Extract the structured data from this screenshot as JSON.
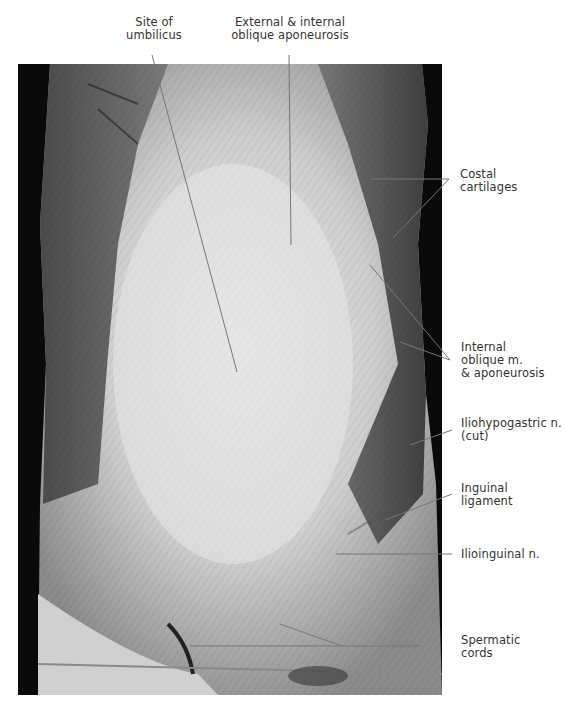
{
  "figure": {
    "labels": {
      "umbilicus": "Site of\numbilicus",
      "aponeurosis": "External & internal\noblique aponeurosis",
      "costal": "Costal\ncartilages",
      "internal_oblique": "Internal\noblique m.\n& aponeurosis",
      "iliohypogastric": "Iliohypogastric n.\n(cut)",
      "inguinal": "Inguinal\nligament",
      "ilioinguinal": "Ilioinguinal n.",
      "spermatic": "Spermatic\ncords"
    }
  }
}
